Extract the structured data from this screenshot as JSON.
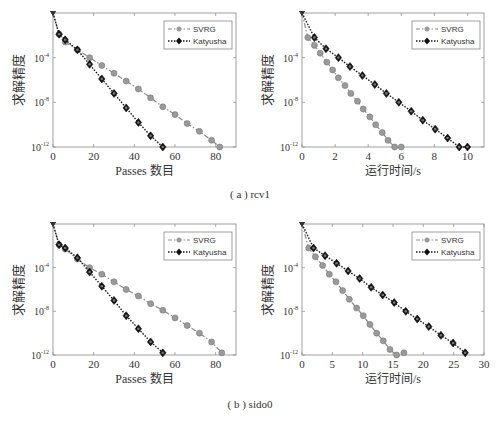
{
  "figure": {
    "captions": [
      "( a ) rcv1",
      "( b ) sido0"
    ]
  },
  "colors": {
    "svrg": "#8a8a8a",
    "katyusha": "#1a1a1a",
    "axis": "#666666"
  },
  "chart_data": [
    {
      "id": "rcv1-passes",
      "type": "line",
      "title": "",
      "xlabel": "Passes 数目",
      "ylabel": "求解精度",
      "xlim": [
        0,
        90
      ],
      "ylim_log10": [
        -12,
        0
      ],
      "xticks": [
        0,
        20,
        40,
        60,
        80
      ],
      "yticks": [
        "10^-4",
        "10^-8",
        "10^-12"
      ],
      "ytick_values_log10": [
        -4,
        -8,
        -12
      ],
      "yscale": "log",
      "grid": false,
      "legend": {
        "position": "upper right",
        "entries": [
          "SVRG",
          "Katyusha"
        ]
      },
      "series": [
        {
          "name": "SVRG",
          "style": "dash-dot, gray circle markers",
          "x": [
            0,
            3,
            6,
            12,
            18,
            24,
            30,
            36,
            42,
            48,
            54,
            60,
            66,
            72,
            78,
            82
          ],
          "log10_y": [
            0,
            -1.9,
            -2.6,
            -3.3,
            -4.0,
            -4.7,
            -5.4,
            -6.1,
            -6.8,
            -7.6,
            -8.4,
            -9.1,
            -9.9,
            -10.6,
            -11.4,
            -12.0
          ]
        },
        {
          "name": "Katyusha",
          "style": "dotted, black diamond markers",
          "x": [
            0,
            3,
            6,
            12,
            18,
            24,
            30,
            36,
            42,
            48,
            54
          ],
          "log10_y": [
            0,
            -1.9,
            -2.4,
            -3.3,
            -4.6,
            -5.9,
            -7.2,
            -8.5,
            -9.8,
            -11.0,
            -12.0
          ]
        }
      ]
    },
    {
      "id": "rcv1-time",
      "type": "line",
      "title": "",
      "xlabel": "运行时间/s",
      "ylabel": "求解精度",
      "xlim": [
        0,
        11
      ],
      "ylim_log10": [
        -12,
        0
      ],
      "xticks": [
        0,
        2,
        4,
        6,
        8,
        10
      ],
      "yticks": [
        "10^-4",
        "10^-8",
        "10^-12"
      ],
      "ytick_values_log10": [
        -4,
        -8,
        -12
      ],
      "yscale": "log",
      "grid": false,
      "legend": {
        "position": "upper right",
        "entries": [
          "SVRG",
          "Katyusha"
        ]
      },
      "series": [
        {
          "name": "SVRG",
          "style": "dash-dot, gray circle markers",
          "x": [
            0,
            0.35,
            0.75,
            1.1,
            1.5,
            1.85,
            2.2,
            2.6,
            2.95,
            3.35,
            3.7,
            4.1,
            4.45,
            4.85,
            5.2,
            5.6,
            6.0
          ],
          "log10_y": [
            0,
            -2.2,
            -2.9,
            -3.6,
            -4.4,
            -5.1,
            -5.8,
            -6.5,
            -7.2,
            -7.9,
            -8.6,
            -9.3,
            -10.0,
            -10.7,
            -11.4,
            -12.0,
            -12.0
          ]
        },
        {
          "name": "Katyusha",
          "style": "dotted, black diamond markers",
          "x": [
            0,
            0.75,
            1.45,
            2.2,
            2.9,
            3.65,
            4.4,
            5.1,
            5.85,
            6.6,
            7.3,
            8.05,
            8.8,
            9.5,
            10.0
          ],
          "log10_y": [
            0,
            -2.2,
            -3.2,
            -4.0,
            -4.8,
            -5.6,
            -6.4,
            -7.2,
            -8.0,
            -8.8,
            -9.6,
            -10.4,
            -11.2,
            -12.0,
            -12.0
          ]
        }
      ]
    },
    {
      "id": "sido0-passes",
      "type": "line",
      "title": "",
      "xlabel": "Passes 数目",
      "ylabel": "求解精度",
      "xlim": [
        0,
        90
      ],
      "ylim_log10": [
        -12,
        0
      ],
      "xticks": [
        0,
        20,
        40,
        60,
        80
      ],
      "yticks": [
        "10^-4",
        "10^-8",
        "10^-12"
      ],
      "ytick_values_log10": [
        -4,
        -8,
        -12
      ],
      "yscale": "log",
      "grid": false,
      "legend": {
        "position": "upper right",
        "entries": [
          "SVRG",
          "Katyusha"
        ]
      },
      "series": [
        {
          "name": "SVRG",
          "style": "dash-dot, gray circle markers",
          "x": [
            0,
            3,
            6,
            12,
            18,
            24,
            30,
            36,
            42,
            48,
            54,
            60,
            66,
            72,
            78,
            83
          ],
          "log10_y": [
            0,
            -1.9,
            -2.3,
            -3.2,
            -4.0,
            -4.6,
            -5.3,
            -6.0,
            -6.6,
            -7.3,
            -7.9,
            -8.6,
            -9.3,
            -10.0,
            -10.8,
            -11.8
          ]
        },
        {
          "name": "Katyusha",
          "style": "dotted, black diamond markers",
          "x": [
            0,
            3,
            6,
            12,
            18,
            24,
            30,
            36,
            42,
            48,
            54
          ],
          "log10_y": [
            0,
            -1.9,
            -2.2,
            -3.1,
            -4.4,
            -5.7,
            -7.0,
            -8.4,
            -9.6,
            -10.8,
            -11.8
          ]
        }
      ]
    },
    {
      "id": "sido0-time",
      "type": "line",
      "title": "",
      "xlabel": "运行时间/s",
      "ylabel": "求解精度",
      "xlim": [
        0,
        30
      ],
      "ylim_log10": [
        -12,
        0
      ],
      "xticks": [
        0,
        5,
        10,
        15,
        20,
        25,
        30
      ],
      "yticks": [
        "10^-4",
        "10^-8",
        "10^-12"
      ],
      "ytick_values_log10": [
        -4,
        -8,
        -12
      ],
      "yscale": "log",
      "grid": false,
      "legend": {
        "position": "upper right",
        "entries": [
          "SVRG",
          "Katyusha"
        ]
      },
      "series": [
        {
          "name": "SVRG",
          "style": "dash-dot, gray circle markers",
          "x": [
            0,
            1.1,
            2.2,
            3.4,
            4.5,
            5.6,
            6.7,
            7.8,
            9.0,
            10.1,
            11.2,
            12.3,
            13.4,
            14.5,
            15.6,
            16.8
          ],
          "log10_y": [
            0,
            -2.2,
            -3.0,
            -3.8,
            -4.6,
            -5.3,
            -6.1,
            -6.9,
            -7.7,
            -8.4,
            -9.2,
            -10.0,
            -10.7,
            -11.5,
            -12.3,
            -11.8
          ]
        },
        {
          "name": "Katyusha",
          "style": "dotted, black diamond markers",
          "x": [
            0,
            1.9,
            3.8,
            5.7,
            7.6,
            9.5,
            11.4,
            13.3,
            15.2,
            17.1,
            19.0,
            20.9,
            22.9,
            24.9,
            26.9
          ],
          "log10_y": [
            0,
            -2.2,
            -2.9,
            -3.6,
            -4.3,
            -5.0,
            -5.8,
            -6.5,
            -7.2,
            -8.0,
            -8.7,
            -9.4,
            -10.2,
            -10.9,
            -11.8
          ]
        }
      ]
    }
  ]
}
